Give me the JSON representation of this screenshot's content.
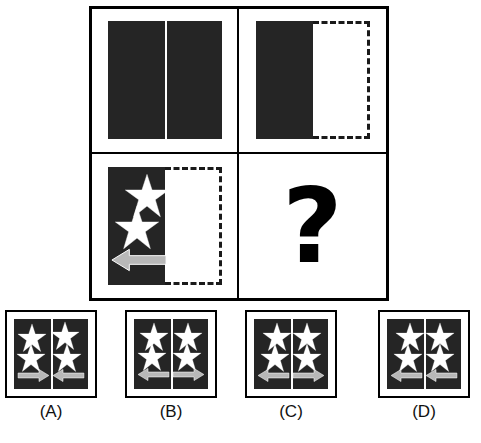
{
  "puzzle": {
    "type": "visual-analogy-matrix",
    "question_mark": "?",
    "matrix": {
      "rows": 2,
      "cols": 2,
      "cells": [
        {
          "id": "cell-1",
          "position": "row1-col1",
          "left_half": {
            "fill": "dark",
            "color": "#252525",
            "border": "solid"
          },
          "right_half": {
            "fill": "dark",
            "color": "#252525",
            "border": "solid"
          },
          "divider": "white-vertical-line",
          "stars": 0,
          "arrows": []
        },
        {
          "id": "cell-2",
          "position": "row1-col2",
          "left_half": {
            "fill": "dark",
            "color": "#252525",
            "border": "solid"
          },
          "right_half": {
            "fill": "white",
            "color": "#ffffff",
            "border": "dashed"
          },
          "divider": "none",
          "stars": 0,
          "arrows": []
        },
        {
          "id": "cell-3",
          "position": "row2-col1",
          "left_half": {
            "fill": "dark",
            "color": "#252525",
            "border": "solid"
          },
          "right_half": {
            "fill": "white",
            "color": "#ffffff",
            "border": "dashed"
          },
          "divider": "none",
          "stars": 2,
          "arrows": [
            "left"
          ]
        },
        {
          "id": "cell-4",
          "position": "row2-col2",
          "content": "question-mark"
        }
      ]
    },
    "options": [
      {
        "label": "(A)",
        "key": "A",
        "stars": 4,
        "left_arrow": "right",
        "right_arrow": "left",
        "arrow_pattern": "inward",
        "background": "#252525"
      },
      {
        "label": "(B)",
        "key": "B",
        "stars": 4,
        "left_arrow": "left",
        "right_arrow": "right",
        "arrow_pattern": "outward",
        "background": "#252525"
      },
      {
        "label": "(C)",
        "key": "C",
        "stars": 4,
        "left_arrow": "left",
        "right_arrow": "right",
        "arrow_pattern": "outward",
        "background": "#252525"
      },
      {
        "label": "(D)",
        "key": "D",
        "stars": 4,
        "left_arrow": "left",
        "right_arrow": "left",
        "arrow_pattern": "both-left",
        "background": "#252525"
      }
    ]
  },
  "colors": {
    "dark_fill": "#252525",
    "star_fill": "#ffffff",
    "arrow_fill": "#b8b8b8",
    "arrow_outline": "#ffffff",
    "border": "#000000",
    "background": "#ffffff"
  }
}
